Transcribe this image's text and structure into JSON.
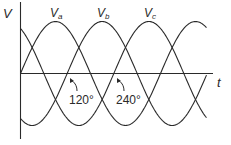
{
  "diagram": {
    "axes": {
      "y_label": "V",
      "x_label": "t"
    },
    "phases": [
      {
        "label_main": "V",
        "label_sub": "a",
        "phase_deg": 0
      },
      {
        "label_main": "V",
        "label_sub": "b",
        "phase_deg": 120
      },
      {
        "label_main": "V",
        "label_sub": "c",
        "phase_deg": 240
      }
    ],
    "annotations": [
      {
        "text": "120°"
      },
      {
        "text": "240°"
      }
    ],
    "colors": {
      "line": "#2a2a2a",
      "background": "#ffffff"
    }
  }
}
